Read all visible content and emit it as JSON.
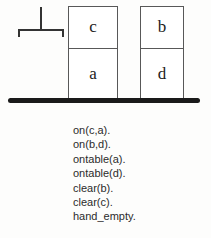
{
  "diagram": {
    "table": {
      "name": "table-surface",
      "color": "#1a1a1a"
    },
    "gripper": {
      "name": "gripper",
      "state": "hand_empty",
      "color": "#333333"
    },
    "stacks": [
      {
        "name": "left-stack",
        "blocks": [
          {
            "id": "c",
            "label": "c",
            "position": "top"
          },
          {
            "id": "a",
            "label": "a",
            "position": "bottom"
          }
        ]
      },
      {
        "name": "right-stack",
        "blocks": [
          {
            "id": "b",
            "label": "b",
            "position": "top"
          },
          {
            "id": "d",
            "label": "d",
            "position": "bottom"
          }
        ]
      }
    ],
    "block_border_color": "#585858"
  },
  "state_list": {
    "predicates": [
      "on(c,a).",
      "on(b,d).",
      "ontable(a).",
      "ontable(d).",
      "clear(b).",
      "clear(c).",
      "hand_empty."
    ]
  }
}
